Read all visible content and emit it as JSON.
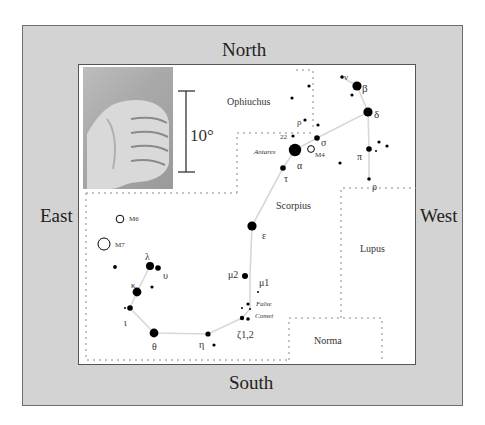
{
  "directions": {
    "north": "North",
    "south": "South",
    "east": "East",
    "west": "West"
  },
  "scale": {
    "label": "10°"
  },
  "photo": {
    "alt": "fist held at arm's length"
  },
  "constellations": [
    {
      "name": "Ophiuchus"
    },
    {
      "name": "Scorpius"
    },
    {
      "name": "Lupus"
    },
    {
      "name": "Norma"
    }
  ],
  "stars": {
    "beta": "β",
    "delta": "δ",
    "nu": "ν",
    "pi": "π",
    "rho": "ρ",
    "sigma": "σ",
    "alpha": "α",
    "tau": "τ",
    "epsilon": "ε",
    "mu2": "μ2",
    "mu1": "μ1",
    "zeta": "ζ1,2",
    "eta": "η",
    "theta": "θ",
    "iota": "ι",
    "kappa": "κ",
    "lambda": "λ",
    "upsilon": "υ",
    "rho_oph": "ρ",
    "twenty_two": "22",
    "antares": "Antares"
  },
  "objects": {
    "m4": "M4",
    "m6": "M6",
    "m7": "M7",
    "false_comet_1": "False",
    "false_comet_2": "Comet"
  },
  "colors": {
    "frame": "#d3d3d3",
    "panel": "#ffffff",
    "star": "#000000",
    "line": "#d8d8d8",
    "boundary": "#888888"
  }
}
